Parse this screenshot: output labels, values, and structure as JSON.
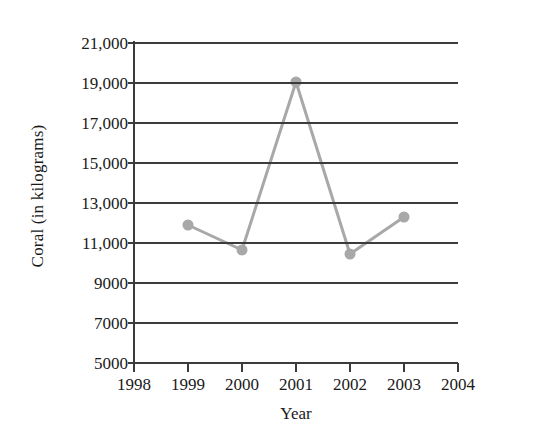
{
  "chart_data": {
    "type": "line",
    "title": "",
    "subtitle": "",
    "xlabel": "Year",
    "ylabel": "Coral (in kilograms)",
    "x": [
      1999,
      2000,
      2001,
      2002,
      2003
    ],
    "values": [
      11900,
      10650,
      19050,
      10450,
      12300
    ],
    "series": [
      {
        "name": "Coral",
        "x": [
          1999,
          2000,
          2001,
          2002,
          2003
        ],
        "values": [
          11900,
          10650,
          19050,
          10450,
          12300
        ]
      }
    ],
    "xlim": [
      1998,
      2004
    ],
    "ylim": [
      5000,
      21000
    ],
    "xticks": [
      1998,
      1999,
      2000,
      2001,
      2002,
      2003,
      2004
    ],
    "xtick_labels": [
      "1998",
      "1999",
      "2000",
      "2001",
      "2002",
      "2003",
      "2004"
    ],
    "yticks": [
      5000,
      7000,
      9000,
      11000,
      13000,
      15000,
      17000,
      19000,
      21000
    ],
    "ytick_labels": [
      "5000",
      "7000",
      "9000",
      "11,000",
      "13,000",
      "15,000",
      "17,000",
      "19,000",
      "21,000"
    ],
    "grid": "horizontal",
    "legend": "none",
    "colors": {
      "line": "#a8a8a8",
      "marker": "#a8a8a8",
      "axis": "#3b3b3b",
      "grid": "#3b3b3b",
      "background": "#ffffff",
      "text": "#1a1a1a"
    }
  }
}
